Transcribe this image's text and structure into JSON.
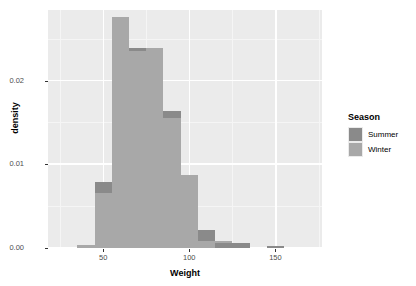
{
  "chart_data": {
    "type": "bar",
    "subtype": "overlapping-histogram",
    "title": "",
    "xlabel": "Weight",
    "ylabel": "density",
    "xlim": [
      18,
      177
    ],
    "ylim": [
      0,
      0.0285
    ],
    "x_ticks": [
      50,
      100,
      150
    ],
    "x_tick_labels": [
      "50",
      "100",
      "150"
    ],
    "y_ticks": [
      0.0,
      0.01,
      0.02
    ],
    "y_tick_labels": [
      "0.00",
      "0.01",
      "0.02"
    ],
    "grid": true,
    "grid_major_y": [
      0.0,
      0.01,
      0.02
    ],
    "grid_minor_y": [
      0.005,
      0.015,
      0.025
    ],
    "grid_major_x": [
      50,
      100,
      150
    ],
    "grid_minor_x": [
      25,
      75,
      125,
      175
    ],
    "legend_position": "right",
    "bin_width": 10,
    "bin_edges": [
      25,
      35,
      45,
      55,
      65,
      75,
      85,
      95,
      105,
      115,
      125,
      135,
      145,
      155
    ],
    "series": [
      {
        "name": "Summer",
        "color": "#8a8a8a",
        "values": [
          0.0,
          0.0004,
          0.0079,
          0.0277,
          0.024,
          0.024,
          0.0164,
          0.0087,
          0.0022,
          0.0006,
          0.0006,
          0.0,
          0.0002,
          0.0
        ]
      },
      {
        "name": "Winter",
        "color": "#a8a8a8",
        "values": [
          0.0,
          0.0004,
          0.0066,
          0.0277,
          0.0236,
          0.024,
          0.0156,
          0.0087,
          0.0008,
          0.0008,
          0.0,
          0.0,
          0.0,
          0.0
        ]
      }
    ]
  },
  "legend": {
    "title": "Season",
    "items": [
      {
        "label": "Summer",
        "color": "#8a8a8a"
      },
      {
        "label": "Winter",
        "color": "#a8a8a8"
      }
    ]
  },
  "axes": {
    "x_title": "Weight",
    "y_title": "density"
  },
  "colors": {
    "panel_background": "#ebebeb",
    "grid_major": "#ffffff",
    "grid_minor": "#f5f5f5",
    "summer": "#8a8a8a",
    "winter": "#a8a8a8",
    "axis_text": "#4d4d4d",
    "title_text": "#000000"
  }
}
